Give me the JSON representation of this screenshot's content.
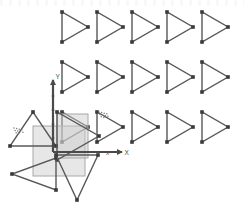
{
  "canvas": {
    "width": 244,
    "height": 205,
    "background_color": "#ffffff",
    "stroke_color": "#595959",
    "vertex_marker_color": "#3a3a3a",
    "selection_fill_color": "#c9c9c9",
    "selection_stroke_color": "#a8a8a8",
    "axis_color": "#4a4a4a",
    "hatch_color": "#7d7d7d",
    "top_artifact_label": "",
    "axes": {
      "x_label": "X",
      "y_label": "Y",
      "secondary_x_label": "x",
      "origin_x": 53,
      "origin_y": 152,
      "x_axis_end": 122,
      "y_axis_end": 80
    },
    "grid": {
      "rows": 3,
      "columns": 5,
      "column_spacing": 35,
      "row_spacing": 50,
      "first_x": 62,
      "first_y": 12,
      "triangle_width": 26,
      "triangle_height": 30,
      "orientation": "right"
    },
    "transform_instances": [
      {
        "name": "triangle-up",
        "orientation": "up",
        "x": 10,
        "y": 112,
        "width": 46,
        "height": 34
      },
      {
        "name": "triangle-right-origin",
        "orientation": "right",
        "x": 57,
        "y": 112,
        "width": 42,
        "height": 48
      },
      {
        "name": "triangle-left",
        "orientation": "left",
        "x": 12,
        "y": 158,
        "width": 44,
        "height": 32
      },
      {
        "name": "triangle-down",
        "orientation": "down",
        "x": 56,
        "y": 155,
        "width": 42,
        "height": 45
      }
    ],
    "selection_boxes": [
      {
        "name": "selection-box-outer",
        "x": 33,
        "y": 126,
        "width": 52,
        "height": 50
      },
      {
        "name": "selection-box-inner",
        "x": 57,
        "y": 114,
        "width": 31,
        "height": 44
      }
    ],
    "hatch_marks": [
      {
        "name": "hatch-mark-left",
        "x": 14,
        "y": 128
      },
      {
        "name": "hatch-mark-row3-c2",
        "x": 99,
        "y": 112
      }
    ]
  }
}
